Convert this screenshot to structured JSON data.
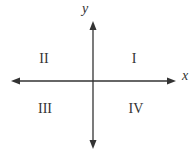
{
  "diagram": {
    "type": "coordinate-plane-quadrants",
    "axes": {
      "x_label": "x",
      "y_label": "y",
      "color": "#333333"
    },
    "quadrants": [
      {
        "id": "I",
        "label": "I"
      },
      {
        "id": "II",
        "label": "II"
      },
      {
        "id": "III",
        "label": "III"
      },
      {
        "id": "IV",
        "label": "IV"
      }
    ]
  }
}
